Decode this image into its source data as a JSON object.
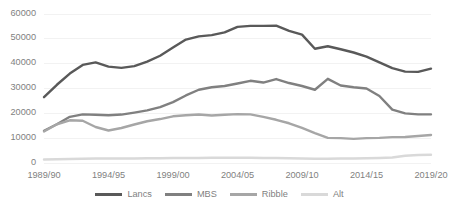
{
  "chart_data": {
    "type": "line",
    "title": "",
    "subtitle": "",
    "xlabel": "",
    "ylabel": "",
    "grid": true,
    "grid_axis": "y",
    "legend_position": "bottom",
    "xlim_labels": [
      "1989/90",
      "2019/20"
    ],
    "ylim": [
      0,
      60000
    ],
    "y_ticks": [
      0,
      10000,
      20000,
      30000,
      40000,
      50000,
      60000
    ],
    "y_tick_labels": [
      "0",
      "10000",
      "20000",
      "30000",
      "40000",
      "50000",
      "60000"
    ],
    "x_tick_labels": [
      "1989/90",
      "1994/95",
      "1999/00",
      "2004/05",
      "2009/10",
      "2014/15",
      "2019/20"
    ],
    "x_tick_years": [
      1989,
      1994,
      1999,
      2004,
      2009,
      2014,
      2019
    ],
    "x": [
      1989,
      1990,
      1991,
      1992,
      1993,
      1994,
      1995,
      1996,
      1997,
      1998,
      1999,
      2000,
      2001,
      2002,
      2003,
      2004,
      2005,
      2006,
      2007,
      2008,
      2009,
      2010,
      2011,
      2012,
      2013,
      2014,
      2015,
      2016,
      2017,
      2018,
      2019
    ],
    "x_labels": [
      "1989/90",
      "1990/91",
      "1991/92",
      "1992/93",
      "1993/94",
      "1994/95",
      "1995/96",
      "1996/97",
      "1997/98",
      "1998/99",
      "1999/00",
      "2000/01",
      "2001/02",
      "2002/03",
      "2003/04",
      "2004/05",
      "2005/06",
      "2006/07",
      "2007/08",
      "2008/09",
      "2009/10",
      "2010/11",
      "2011/12",
      "2012/13",
      "2013/14",
      "2014/15",
      "2015/16",
      "2016/17",
      "2017/18",
      "2018/19",
      "2019/20"
    ],
    "series": [
      {
        "name": "Lancs",
        "color": "#595959",
        "values": [
          26500,
          31500,
          36000,
          39500,
          40500,
          38800,
          38300,
          39000,
          40800,
          43200,
          46500,
          49700,
          51000,
          51500,
          52600,
          54800,
          55200,
          55200,
          55300,
          53200,
          51700,
          46000,
          47000,
          45800,
          44500,
          42800,
          40500,
          38200,
          36800,
          36700,
          38000
        ]
      },
      {
        "name": "MBS",
        "color": "#808080",
        "values": [
          13000,
          15600,
          18600,
          19600,
          19400,
          19200,
          19500,
          20300,
          21200,
          22500,
          24500,
          27200,
          29500,
          30500,
          31000,
          32000,
          33100,
          32400,
          33800,
          32200,
          31000,
          29500,
          33900,
          31200,
          30500,
          30000,
          27000,
          21500,
          20000,
          19600,
          19600
        ]
      },
      {
        "name": "Ribble",
        "color": "#a6a6a6",
        "values": [
          12700,
          15600,
          17200,
          17000,
          14500,
          13100,
          14100,
          15500,
          16800,
          17700,
          18800,
          19200,
          19500,
          19100,
          19400,
          19700,
          19600,
          18600,
          17400,
          16000,
          14100,
          12000,
          10100,
          10000,
          9700,
          10000,
          10100,
          10400,
          10500,
          10900,
          11300
        ]
      },
      {
        "name": "Alt",
        "color": "#d9d9d9",
        "values": [
          1400,
          1500,
          1600,
          1700,
          1800,
          1800,
          1800,
          1800,
          1900,
          1900,
          2000,
          2000,
          2000,
          2100,
          2100,
          2100,
          2100,
          2000,
          2000,
          1900,
          1800,
          1700,
          1700,
          1800,
          1800,
          1900,
          2000,
          2200,
          2900,
          3200,
          3300
        ]
      }
    ]
  },
  "legend": {
    "items": [
      {
        "label": "Lancs",
        "color": "#595959"
      },
      {
        "label": "MBS",
        "color": "#808080"
      },
      {
        "label": "Ribble",
        "color": "#a6a6a6"
      },
      {
        "label": "Alt",
        "color": "#d9d9d9"
      }
    ]
  },
  "style": {
    "grid_color": "#f2f2f2",
    "text_color": "#7f7f7f",
    "background": "#ffffff"
  }
}
